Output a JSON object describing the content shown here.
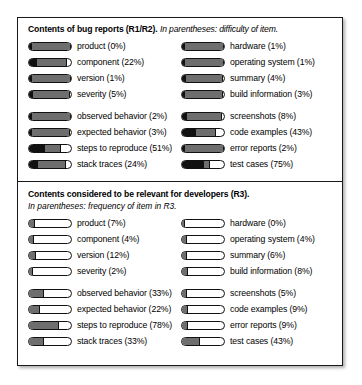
{
  "figure": {
    "panels": [
      {
        "id": "r1r2",
        "title": "Contents of bug reports (R1/R2).",
        "subtitle": "In parentheses: difficulty of item.",
        "groups": [
          {
            "rows": [
              {
                "left": {
                  "label": "product (0%)",
                  "value": 0
                },
                "right": {
                  "label": "hardware (1%)",
                  "value": 1
                }
              },
              {
                "left": {
                  "label": "component (22%)",
                  "value": 22
                },
                "right": {
                  "label": "operating system (1%)",
                  "value": 1
                }
              },
              {
                "left": {
                  "label": "version (1%)",
                  "value": 1
                },
                "right": {
                  "label": "summary (4%)",
                  "value": 4
                }
              },
              {
                "left": {
                  "label": "severity (5%)",
                  "value": 5
                },
                "right": {
                  "label": "build information (3%)",
                  "value": 3
                }
              }
            ]
          },
          {
            "rows": [
              {
                "left": {
                  "label": "observed behavior (2%)",
                  "value": 2
                },
                "right": {
                  "label": "screenshots (8%)",
                  "value": 8
                }
              },
              {
                "left": {
                  "label": "expected behavior (3%)",
                  "value": 3
                },
                "right": {
                  "label": "code examples (43%)",
                  "value": 43
                }
              },
              {
                "left": {
                  "label": "steps to reproduce (51%)",
                  "value": 51
                },
                "right": {
                  "label": "error reports (2%)",
                  "value": 2
                }
              },
              {
                "left": {
                  "label": "stack traces (24%)",
                  "value": 24
                },
                "right": {
                  "label": "test cases (75%)",
                  "value": 75
                }
              }
            ]
          }
        ]
      },
      {
        "id": "r3",
        "title": "Contents considered to be relevant for developers (R3).",
        "subtitle": "In parentheses: frequency of item in R3.",
        "groups": [
          {
            "rows": [
              {
                "left": {
                  "label": "product (7%)",
                  "value": 7
                },
                "right": {
                  "label": "hardware (0%)",
                  "value": 0
                }
              },
              {
                "left": {
                  "label": "component (4%)",
                  "value": 4
                },
                "right": {
                  "label": "operating system (4%)",
                  "value": 4
                }
              },
              {
                "left": {
                  "label": "version (12%)",
                  "value": 12
                },
                "right": {
                  "label": "summary (6%)",
                  "value": 6
                }
              },
              {
                "left": {
                  "label": "severity (2%)",
                  "value": 2
                },
                "right": {
                  "label": "build information (8%)",
                  "value": 8
                }
              }
            ]
          },
          {
            "rows": [
              {
                "left": {
                  "label": "observed behavior (33%)",
                  "value": 33
                },
                "right": {
                  "label": "screenshots (5%)",
                  "value": 5
                }
              },
              {
                "left": {
                  "label": "expected behavior (22%)",
                  "value": 22
                },
                "right": {
                  "label": "code examples (9%)",
                  "value": 9
                }
              },
              {
                "left": {
                  "label": "steps to reproduce (78%)",
                  "value": 78
                },
                "right": {
                  "label": "error reports (9%)",
                  "value": 9
                }
              },
              {
                "left": {
                  "label": "stack traces (33%)",
                  "value": 33
                },
                "right": {
                  "label": "test cases (43%)",
                  "value": 43
                }
              }
            ]
          }
        ]
      }
    ]
  },
  "chart_data": {
    "type": "bar",
    "xlabel": "",
    "ylabel": "",
    "xlim": [
      0,
      100
    ],
    "grid": false,
    "legend": "none",
    "categories": [
      "product",
      "component",
      "version",
      "severity",
      "observed behavior",
      "expected behavior",
      "steps to reproduce",
      "stack traces",
      "hardware",
      "operating system",
      "summary",
      "build information",
      "screenshots",
      "code examples",
      "error reports",
      "test cases"
    ],
    "series": [
      {
        "name": "difficulty of item (R1/R2)",
        "values": [
          0,
          22,
          1,
          5,
          2,
          3,
          51,
          24,
          1,
          1,
          4,
          3,
          8,
          43,
          2,
          75
        ]
      },
      {
        "name": "frequency of item in R3",
        "values": [
          7,
          4,
          12,
          2,
          33,
          22,
          78,
          33,
          0,
          4,
          6,
          8,
          5,
          9,
          9,
          43
        ]
      }
    ],
    "units": "percent"
  }
}
